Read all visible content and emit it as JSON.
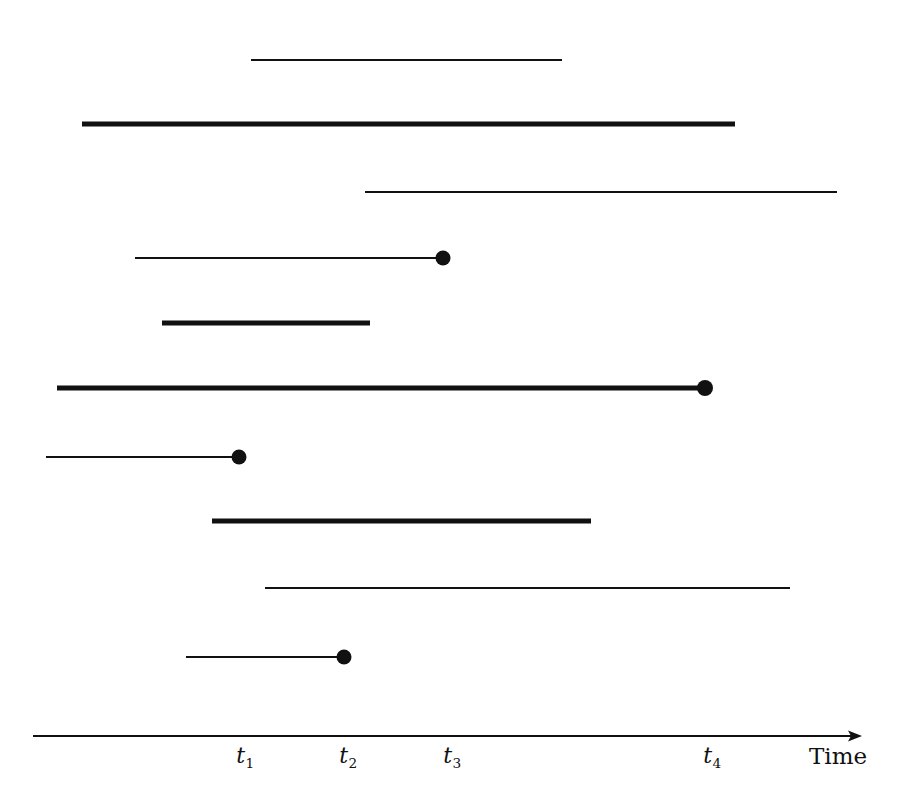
{
  "figure": {
    "type": "timeline-interval-diagram",
    "width": 904,
    "height": 811,
    "background_color": "#ffffff",
    "stroke_color": "#111111"
  },
  "axis": {
    "name": "Time",
    "name_x": 838,
    "name_y": 745,
    "line_y": 736,
    "line_x_start": 33,
    "line_x_end": 862,
    "arrow": "right-arrowhead",
    "ticks": [
      {
        "label": "t",
        "subscript": "1",
        "x": 245,
        "y": 745
      },
      {
        "label": "t",
        "subscript": "2",
        "x": 348,
        "y": 745
      },
      {
        "label": "t",
        "subscript": "3",
        "x": 452,
        "y": 745
      },
      {
        "label": "t",
        "subscript": "4",
        "x": 712,
        "y": 745
      }
    ]
  },
  "chart_data": {
    "type": "line",
    "title": "",
    "xlabel": "Time",
    "ylabel": "",
    "xlim": [
      33,
      862
    ],
    "grid": false,
    "legend": "none",
    "annotations": [
      "thin lines = one lifetime style",
      "thick lines = another lifetime style",
      "filled dot = terminal endpoint event"
    ],
    "tick_positions_px": {
      "t1": 245,
      "t2": 348,
      "t3": 452,
      "t4": 712
    },
    "intervals": [
      {
        "id": 1,
        "y": 60,
        "x_start": 251,
        "x_end": 562,
        "weight": "thin",
        "end_dot": false
      },
      {
        "id": 2,
        "y": 124,
        "x_start": 82,
        "x_end": 735,
        "weight": "thick",
        "end_dot": false
      },
      {
        "id": 3,
        "y": 192,
        "x_start": 365,
        "x_end": 837,
        "weight": "thin",
        "end_dot": false
      },
      {
        "id": 4,
        "y": 258,
        "x_start": 135,
        "x_end": 443,
        "weight": "thin",
        "end_dot": true
      },
      {
        "id": 5,
        "y": 323,
        "x_start": 162,
        "x_end": 370,
        "weight": "thick",
        "end_dot": false
      },
      {
        "id": 6,
        "y": 388,
        "x_start": 57,
        "x_end": 705,
        "weight": "thick",
        "end_dot": true
      },
      {
        "id": 7,
        "y": 457,
        "x_start": 46,
        "x_end": 239,
        "weight": "thin",
        "end_dot": true
      },
      {
        "id": 8,
        "y": 521,
        "x_start": 212,
        "x_end": 591,
        "weight": "thick",
        "end_dot": false
      },
      {
        "id": 9,
        "y": 588,
        "x_start": 265,
        "x_end": 790,
        "weight": "thin",
        "end_dot": false
      },
      {
        "id": 10,
        "y": 657,
        "x_start": 186,
        "x_end": 344,
        "weight": "thin",
        "end_dot": true
      }
    ]
  }
}
